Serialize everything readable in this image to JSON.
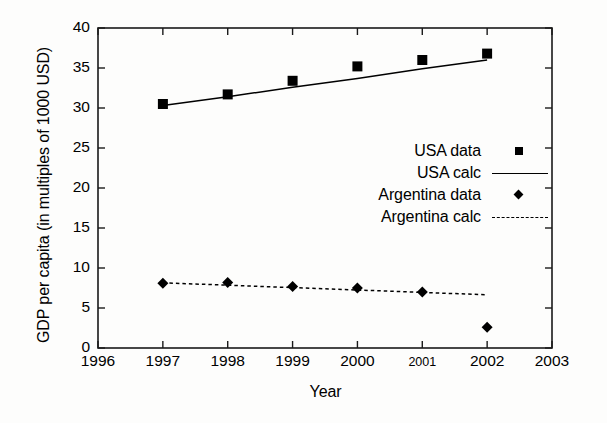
{
  "chart_data": {
    "type": "scatter",
    "title": "",
    "xlabel": "Year",
    "ylabel": "GDP per capita (in multiples of 1000 USD)",
    "xlim": [
      1996,
      2003
    ],
    "ylim": [
      0,
      40
    ],
    "xticks": [
      1996,
      1997,
      1998,
      1999,
      2000,
      2001,
      2002,
      2003
    ],
    "xtick_labels": [
      "1996",
      "1997",
      "1998",
      "1999",
      "2000",
      "2001",
      "2002",
      "2003"
    ],
    "yticks": [
      0,
      5,
      10,
      15,
      20,
      25,
      30,
      35,
      40
    ],
    "ytick_labels": [
      "0",
      "5",
      "10",
      "15",
      "20",
      "25",
      "30",
      "35",
      "40"
    ],
    "grid": false,
    "legend_position": "center-right",
    "x": [
      1997,
      1998,
      1999,
      2000,
      2001,
      2002
    ],
    "series": [
      {
        "name": "USA data",
        "marker": "square",
        "style": "points",
        "color": "#000000",
        "values": [
          30.5,
          31.7,
          33.4,
          35.2,
          36.0,
          36.8
        ]
      },
      {
        "name": "USA calc",
        "marker": "none",
        "style": "solid-line",
        "color": "#000000",
        "values": [
          30.3,
          31.4,
          32.6,
          33.7,
          34.9,
          36.0
        ]
      },
      {
        "name": "Argentina data",
        "marker": "diamond",
        "style": "points",
        "color": "#000000",
        "values": [
          8.1,
          8.2,
          7.7,
          7.5,
          7.0,
          2.6
        ]
      },
      {
        "name": "Argentina calc",
        "marker": "none",
        "style": "dashed-line",
        "color": "#000000",
        "values": [
          8.15,
          7.85,
          7.55,
          7.25,
          6.95,
          6.65
        ]
      }
    ]
  },
  "legend": {
    "entries": [
      {
        "label": "USA data",
        "key": "square-marker"
      },
      {
        "label": "USA calc",
        "key": "solid-line"
      },
      {
        "label": "Argentina data",
        "key": "diamond-marker"
      },
      {
        "label": "Argentina calc",
        "key": "dashed-line"
      }
    ]
  },
  "axes": {
    "x_title": "Year",
    "y_title": "GDP per capita (in multiples of 1000 USD)"
  }
}
